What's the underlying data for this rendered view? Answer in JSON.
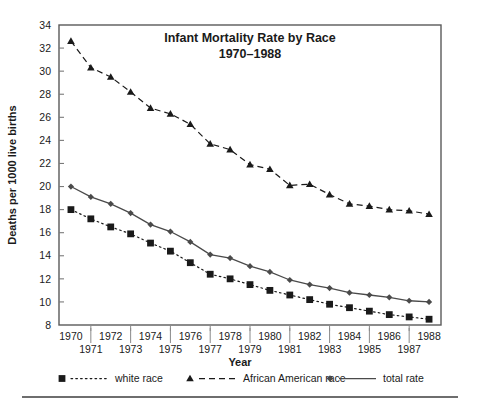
{
  "figure": {
    "background_color": "#ffffff",
    "ink_color": "#1a1a1a",
    "rule_color": "#6e6e6e"
  },
  "chart_data": {
    "type": "line",
    "title": "Infant Mortality Rate by Race",
    "subtitle": "1970–1988",
    "xlabel": "Year",
    "ylabel": "Deaths per 1000 live births",
    "x": [
      1970,
      1971,
      1972,
      1973,
      1974,
      1975,
      1976,
      1977,
      1978,
      1979,
      1980,
      1981,
      1982,
      1983,
      1984,
      1985,
      1986,
      1987,
      1988
    ],
    "xtick_labels_upper": [
      "1970",
      "1972",
      "1974",
      "1976",
      "1978",
      "1980",
      "1982",
      "1984",
      "1986",
      "1988"
    ],
    "xtick_labels_lower": [
      "1971",
      "1973",
      "1975",
      "1977",
      "1979",
      "1981",
      "1983",
      "1985",
      "1987"
    ],
    "ytick_labels": [
      "34",
      "32",
      "30",
      "28",
      "26",
      "24",
      "22",
      "20",
      "18",
      "16",
      "14",
      "12",
      "10",
      "8"
    ],
    "xlim": [
      1969.4,
      1988.6
    ],
    "ylim": [
      8,
      34
    ],
    "grid": false,
    "legend_position": "below",
    "series": [
      {
        "name": "white race",
        "marker": "square",
        "linestyle": "dotted",
        "color": "#1a1a1a",
        "values": [
          18.0,
          17.2,
          16.5,
          15.9,
          15.1,
          14.4,
          13.4,
          12.4,
          12.0,
          11.5,
          11.0,
          10.6,
          10.2,
          9.8,
          9.5,
          9.2,
          8.9,
          8.7,
          8.5
        ]
      },
      {
        "name": "African American race",
        "marker": "triangle",
        "linestyle": "dashed",
        "color": "#1a1a1a",
        "values": [
          32.6,
          30.3,
          29.5,
          28.2,
          26.8,
          26.3,
          25.4,
          23.7,
          23.2,
          21.9,
          21.5,
          20.1,
          20.2,
          19.3,
          18.5,
          18.3,
          18.0,
          17.9,
          17.6
        ]
      },
      {
        "name": "total rate",
        "marker": "diamond",
        "linestyle": "solid",
        "color": "#4a4a4a",
        "values": [
          20.0,
          19.1,
          18.5,
          17.7,
          16.7,
          16.1,
          15.2,
          14.1,
          13.8,
          13.1,
          12.6,
          11.9,
          11.5,
          11.2,
          10.8,
          10.6,
          10.4,
          10.1,
          10.0
        ]
      }
    ]
  }
}
